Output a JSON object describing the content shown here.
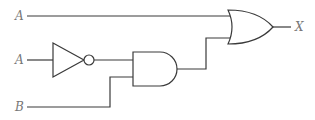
{
  "diagram": {
    "type": "logic-circuit",
    "inputs": [
      {
        "label": "A",
        "id": "input-a-top"
      },
      {
        "label": "A",
        "id": "input-a-middle"
      },
      {
        "label": "B",
        "id": "input-b"
      }
    ],
    "output": {
      "label": "X"
    },
    "gates": [
      {
        "type": "NOT",
        "input": "A"
      },
      {
        "type": "AND",
        "inputs": [
          "NOT A",
          "B"
        ]
      },
      {
        "type": "OR",
        "inputs": [
          "A",
          "AND output"
        ]
      }
    ],
    "expression": "X = A + (A'·B)",
    "colors": {
      "line": "#3a3a3a",
      "label": "#777777",
      "background": "#ffffff"
    }
  }
}
